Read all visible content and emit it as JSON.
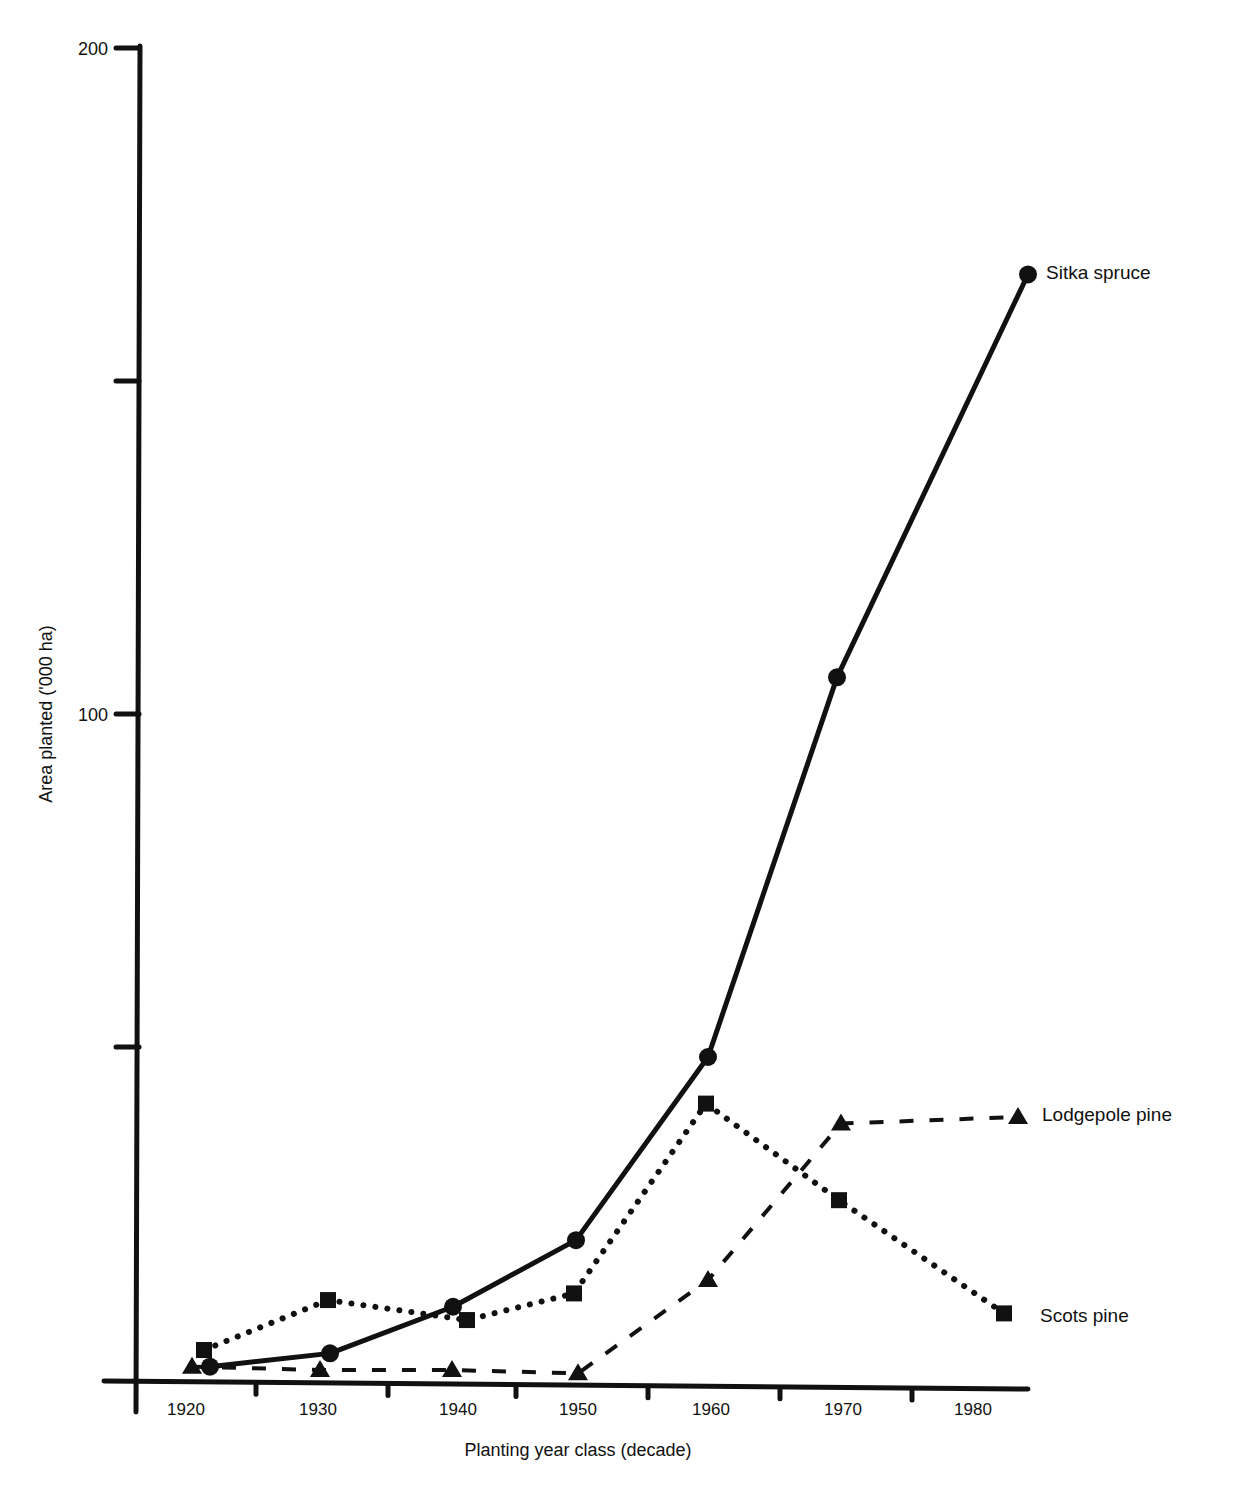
{
  "chart_data": {
    "type": "line",
    "title": "",
    "xlabel": "Planting year class (decade)",
    "ylabel": "Area planted ('000 ha)",
    "ylim": [
      0,
      200
    ],
    "yticks": [
      0,
      50,
      100,
      150,
      200
    ],
    "ytick_labels": [
      "",
      "",
      "100",
      "",
      "200"
    ],
    "categories": [
      "1920",
      "1930",
      "1940",
      "1950",
      "1960",
      "1970",
      "1980"
    ],
    "grid": false,
    "legend_position": "inline-right",
    "series": [
      {
        "name": "Sitka spruce",
        "marker": "circle",
        "line": "solid",
        "values": [
          2,
          4,
          11,
          21,
          48.5,
          105.5,
          166
        ]
      },
      {
        "name": "Scots pine",
        "marker": "square",
        "line": "dotted",
        "values": [
          4.5,
          12,
          9,
          13,
          41.5,
          27,
          10
        ]
      },
      {
        "name": "Lodgepole pine",
        "marker": "triangle",
        "line": "dashed",
        "values": [
          2,
          1.5,
          1.5,
          1,
          15,
          38.5,
          39.5
        ]
      }
    ]
  },
  "layout": {
    "series_x": {
      "Sitka spruce": [
        210,
        330,
        453,
        576,
        708,
        837,
        1028
      ],
      "Scots pine": [
        204,
        328,
        467,
        574,
        706,
        839,
        1004
      ],
      "Lodgepole pine": [
        192,
        320,
        452,
        578,
        708,
        841,
        1018
      ]
    },
    "label_pos": {
      "Sitka spruce": [
        1046,
        279
      ],
      "Scots pine": [
        1040,
        1322
      ],
      "Lodgepole pine": [
        1042,
        1121
      ]
    },
    "category_x": [
      186,
      318,
      458,
      578,
      711,
      843,
      973
    ]
  }
}
